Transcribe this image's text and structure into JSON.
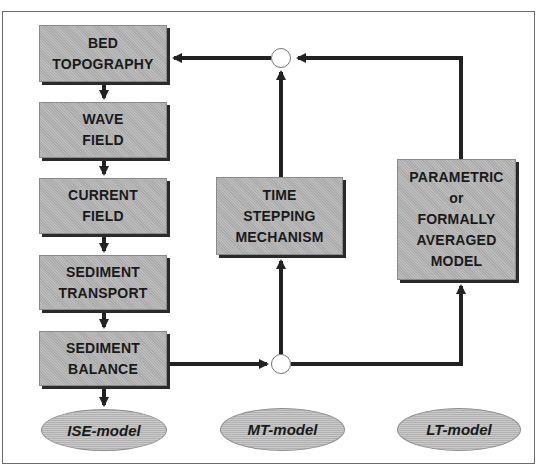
{
  "diagram": {
    "type": "flowchart",
    "colors": {
      "box_fill": "#b4b4b4",
      "box_shadow": "#2a2a2a",
      "arrow": "#222222",
      "ellipse_fill": "#bdbdbd",
      "frame": "#6a6a6a"
    },
    "left_column": [
      {
        "id": "bed",
        "lines": [
          "BED",
          "TOPOGRAPHY"
        ]
      },
      {
        "id": "wave",
        "lines": [
          "WAVE",
          "FIELD"
        ]
      },
      {
        "id": "current",
        "lines": [
          "CURRENT",
          "FIELD"
        ]
      },
      {
        "id": "transport",
        "lines": [
          "SEDIMENT",
          "TRANSPORT"
        ]
      },
      {
        "id": "balance",
        "lines": [
          "SEDIMENT",
          "BALANCE"
        ]
      }
    ],
    "middle_box": {
      "id": "time",
      "lines": [
        "TIME",
        "STEPPING",
        "MECHANISM"
      ]
    },
    "right_box": {
      "id": "param",
      "lines": [
        "PARAMETRIC",
        "or",
        "FORMALLY",
        "AVERAGED",
        "MODEL"
      ]
    },
    "ellipses": [
      {
        "id": "ise",
        "label": "ISE-model"
      },
      {
        "id": "mt",
        "label": "MT-model"
      },
      {
        "id": "lt",
        "label": "LT-model"
      }
    ],
    "junctions": [
      {
        "id": "top-junction"
      },
      {
        "id": "bottom-junction"
      }
    ],
    "edges": [
      {
        "from": "bed",
        "to": "wave"
      },
      {
        "from": "wave",
        "to": "current"
      },
      {
        "from": "current",
        "to": "transport"
      },
      {
        "from": "transport",
        "to": "balance"
      },
      {
        "from": "balance",
        "to": "ise"
      },
      {
        "from": "balance",
        "to": "bottom-junction"
      },
      {
        "from": "bottom-junction",
        "to": "time"
      },
      {
        "from": "bottom-junction",
        "to": "param"
      },
      {
        "from": "time",
        "to": "top-junction"
      },
      {
        "from": "param",
        "to": "top-junction"
      },
      {
        "from": "top-junction",
        "to": "bed"
      }
    ]
  }
}
